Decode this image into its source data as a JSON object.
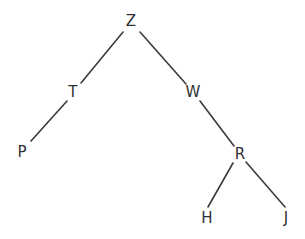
{
  "figure": {
    "background_color": "#ffffff",
    "width": 305,
    "height": 239
  },
  "style": {
    "node_text_color": "#2f3033",
    "edge_color": "#3a3a3f",
    "edge_width": 1.6,
    "font_size": 15
  },
  "tree": {
    "root": "Z",
    "nodes": [
      {
        "id": "z",
        "label": "Z",
        "x": 131,
        "y": 21,
        "depth": 0,
        "parent": null,
        "side": null
      },
      {
        "id": "t",
        "label": "T",
        "x": 73,
        "y": 92,
        "depth": 1,
        "parent": "z",
        "side": "left"
      },
      {
        "id": "w",
        "label": "W",
        "x": 193,
        "y": 92,
        "depth": 1,
        "parent": "z",
        "side": "right"
      },
      {
        "id": "p",
        "label": "P",
        "x": 22,
        "y": 152,
        "depth": 2,
        "parent": "t",
        "side": "left"
      },
      {
        "id": "r",
        "label": "R",
        "x": 240,
        "y": 154,
        "depth": 2,
        "parent": "w",
        "side": "right"
      },
      {
        "id": "h",
        "label": "H",
        "x": 207,
        "y": 218,
        "depth": 3,
        "parent": "r",
        "side": "left"
      },
      {
        "id": "j",
        "label": "J",
        "x": 286,
        "y": 218,
        "depth": 3,
        "parent": "r",
        "side": "right"
      }
    ],
    "edges": [
      {
        "id": "z-t",
        "from": "Z",
        "to": "T",
        "x1": 123,
        "y1": 32,
        "x2": 81,
        "y2": 83
      },
      {
        "id": "z-w",
        "from": "Z",
        "to": "W",
        "x1": 140,
        "y1": 32,
        "x2": 186,
        "y2": 84
      },
      {
        "id": "t-p",
        "from": "T",
        "to": "P",
        "x1": 67,
        "y1": 101,
        "x2": 31,
        "y2": 141
      },
      {
        "id": "w-r",
        "from": "W",
        "to": "R",
        "x1": 200,
        "y1": 101,
        "x2": 234,
        "y2": 146
      },
      {
        "id": "r-h",
        "from": "R",
        "to": "H",
        "x1": 233,
        "y1": 163,
        "x2": 208,
        "y2": 207
      },
      {
        "id": "r-j",
        "from": "R",
        "to": "J",
        "x1": 246,
        "y1": 162,
        "x2": 285,
        "y2": 207
      }
    ]
  },
  "chart_data": {
    "type": "diagram",
    "subtype": "binary-tree",
    "node_count": 7,
    "edge_count": 6,
    "depth": 4,
    "labels": [
      "Z",
      "T",
      "W",
      "P",
      "R",
      "H",
      "J"
    ],
    "adjacency": {
      "Z": {
        "left": "T",
        "right": "W"
      },
      "T": {
        "left": "P",
        "right": null
      },
      "W": {
        "left": null,
        "right": "R"
      },
      "P": {
        "left": null,
        "right": null
      },
      "R": {
        "left": "H",
        "right": "J"
      },
      "H": {
        "left": null,
        "right": null
      },
      "J": {
        "left": null,
        "right": null
      }
    },
    "leaves": [
      "P",
      "H",
      "J"
    ],
    "grid": false,
    "legend": null
  }
}
